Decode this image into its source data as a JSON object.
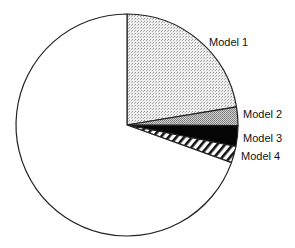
{
  "chart_data": {
    "type": "pie",
    "title": "",
    "start_angle_deg": 0,
    "direction": "clockwise",
    "slices": [
      {
        "label": "Model 1",
        "value": 22.4,
        "pattern": "light-stipple"
      },
      {
        "label": "Model 2",
        "value": 2.7,
        "pattern": "medium-stipple"
      },
      {
        "label": "Model 3",
        "value": 3.0,
        "pattern": "solid-black"
      },
      {
        "label": "Model 4",
        "value": 2.4,
        "pattern": "diagonal-hatch"
      },
      {
        "label": "",
        "value": 69.5,
        "pattern": "blank"
      }
    ],
    "legend": "none (direct labels)"
  },
  "labels": {
    "model1": "Model 1",
    "model2": "Model 2",
    "model3": "Model 3",
    "model4": "Model 4"
  },
  "colors": {
    "stroke": "#222222",
    "light_fill": "#e4e4e4",
    "medium_fill": "#bdbdbd",
    "dark_fill": "#050505"
  }
}
